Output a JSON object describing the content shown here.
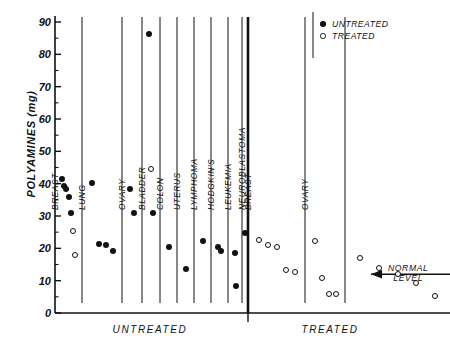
{
  "chart_data": {
    "type": "scatter",
    "title": "",
    "xlabel": "",
    "ylabel": "POLYAMINES (mg)",
    "ylim": [
      0,
      90
    ],
    "ytick_labels": [
      "0",
      "10",
      "20",
      "30",
      "40",
      "50",
      "60",
      "70",
      "80",
      "90"
    ],
    "ytick_values": [
      0,
      10,
      20,
      30,
      40,
      50,
      60,
      70,
      80,
      90
    ],
    "minor_tick_values": [
      5,
      15,
      25,
      35,
      45,
      55,
      65,
      75,
      85
    ],
    "grid": false,
    "legend_position": "top-right",
    "legend": [
      {
        "label": "UNTREATED",
        "marker": "filled-circle"
      },
      {
        "label": "TREATED",
        "marker": "open-circle"
      }
    ],
    "group_captions": [
      "UNTREATED",
      "TREATED"
    ],
    "annotation": {
      "text_line1": "NORMAL",
      "text_line2": "LEVEL",
      "arrow": "left-arrow",
      "value": 12
    },
    "groups": [
      {
        "group": "UNTREATED",
        "columns": [
          {
            "label": "BREAST",
            "points": [
              {
                "v": 41.4,
                "marker": "filled"
              },
              {
                "v": 39.4,
                "marker": "filled"
              },
              {
                "v": 38.3,
                "marker": "filled"
              },
              {
                "v": 36.0,
                "marker": "filled"
              },
              {
                "v": 31.0,
                "marker": "filled"
              },
              {
                "v": 25.5,
                "marker": "open"
              },
              {
                "v": 18.0,
                "marker": "open"
              }
            ]
          },
          {
            "label": "LUNG",
            "points": [
              {
                "v": 40.3,
                "marker": "filled"
              },
              {
                "v": 21.4,
                "marker": "filled"
              },
              {
                "v": 21.1,
                "marker": "filled"
              },
              {
                "v": 19.1,
                "marker": "filled"
              }
            ]
          },
          {
            "label": "OVARY",
            "points": [
              {
                "v": 38.4,
                "marker": "filled"
              },
              {
                "v": 30.9,
                "marker": "filled"
              }
            ]
          },
          {
            "label": "BLADDER",
            "points": [
              {
                "v": 86.4,
                "marker": "filled"
              },
              {
                "v": 44.5,
                "marker": "open"
              },
              {
                "v": 31.0,
                "marker": "filled"
              }
            ]
          },
          {
            "label": "COLON",
            "points": [
              {
                "v": 20.5,
                "marker": "filled"
              }
            ]
          },
          {
            "label": "UTERUS",
            "points": [
              {
                "v": 13.7,
                "marker": "filled"
              }
            ]
          },
          {
            "label": "LYMPHOMA",
            "points": [
              {
                "v": 22.3,
                "marker": "filled"
              }
            ]
          },
          {
            "label": "HODGKIN'S",
            "points": [
              {
                "v": 20.3,
                "marker": "filled"
              },
              {
                "v": 19.3,
                "marker": "filled"
              }
            ]
          },
          {
            "label": "LEUKEMIA",
            "points": [
              {
                "v": 18.6,
                "marker": "filled"
              },
              {
                "v": 8.5,
                "marker": "filled"
              }
            ]
          },
          {
            "label": "NEUROBLASTOMA",
            "points": [
              {
                "v": 24.8,
                "marker": "filled"
              }
            ]
          }
        ]
      },
      {
        "group": "TREATED",
        "columns": [
          {
            "label": "BREAST",
            "points": [
              {
                "v": 22.6,
                "marker": "open"
              },
              {
                "v": 21.0,
                "marker": "open"
              },
              {
                "v": 20.5,
                "marker": "open"
              },
              {
                "v": 13.2,
                "marker": "open"
              },
              {
                "v": 12.6,
                "marker": "open"
              }
            ]
          },
          {
            "label": "OVARY",
            "points": [
              {
                "v": 22.3,
                "marker": "open"
              },
              {
                "v": 10.9,
                "marker": "open"
              },
              {
                "v": 6.0,
                "marker": "open"
              },
              {
                "v": 6.0,
                "marker": "open"
              }
            ]
          },
          {
            "label": "",
            "points": [
              {
                "v": 17.1,
                "marker": "open"
              },
              {
                "v": 14.0,
                "marker": "open"
              },
              {
                "v": 12.2,
                "marker": "open"
              },
              {
                "v": 9.4,
                "marker": "open"
              },
              {
                "v": 5.4,
                "marker": "open"
              }
            ]
          }
        ]
      }
    ]
  }
}
